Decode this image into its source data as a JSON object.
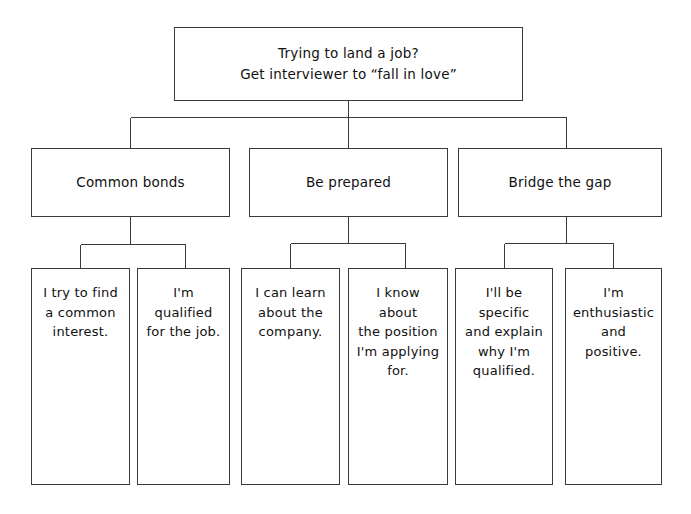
{
  "diagram": {
    "type": "tree",
    "title": "Trying to land a job? Get interviewer to “fall in love”",
    "background_color": "#ffffff",
    "line_color": "#3a3a3a",
    "text_color": "#111111",
    "root": {
      "label": "Trying to land a job?\nGet interviewer to “fall in love”"
    },
    "branches": [
      {
        "label": "Common bonds",
        "leaves": [
          {
            "label": "I try to find\na common\ninterest."
          },
          {
            "label": "I'm qualified\nfor the job."
          }
        ]
      },
      {
        "label": "Be prepared",
        "leaves": [
          {
            "label": "I can learn\nabout the\ncompany."
          },
          {
            "label": "I know about\nthe position\nI'm applying\nfor."
          }
        ]
      },
      {
        "label": "Bridge the gap",
        "leaves": [
          {
            "label": "I'll be specific\nand explain\nwhy I'm\nqualified."
          },
          {
            "label": "I'm\nenthusiastic\nand positive."
          }
        ]
      }
    ]
  }
}
